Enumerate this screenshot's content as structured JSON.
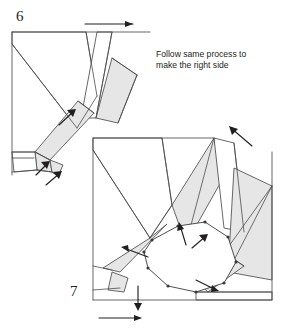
{
  "document": {
    "type": "origami-instruction-diagram",
    "width": 282,
    "height": 331
  },
  "steps": [
    {
      "id": "step-6",
      "number": "6",
      "number_x": 16,
      "number_y": 21,
      "caption": null
    },
    {
      "id": "step-7",
      "number": "7",
      "number_x": 70,
      "number_y": 296,
      "caption": null
    }
  ],
  "caption": {
    "line1": "Follow same process to",
    "line2": "make the right side",
    "x": 156,
    "line1_y": 57,
    "line2_y": 68
  },
  "colors": {
    "paper_white": "#ffffff",
    "paper_shaded": "#e6e6e6",
    "line": "#4d4d4d",
    "ring_line": "#3a3a3a",
    "arrow": "#231f20",
    "text": "#231f20",
    "background": "#ffffff"
  },
  "figure6": {
    "name": "step-6-figure",
    "outline": "M12,32 L150,32 L150,34 M12,32 L12,175",
    "top_edge": "M12,32 L150,32",
    "left_edge": "M12,32 L12,175",
    "bottom_edge": "M12,158 L34,158",
    "faces": [
      {
        "name": "upper-left-triangle-face",
        "points": "12,32 12,44 77,128 97,96 86,32",
        "shaded": false
      },
      {
        "name": "right-flap-white",
        "points": "97,32 112,32 96,118 81,118",
        "shaded": false
      },
      {
        "name": "right-shaded-flap",
        "points": "112,58 137,75 118,123 96,118",
        "shaded": true
      },
      {
        "name": "diagonal-shaded-strip",
        "points": "78,101 94,113 50,160 35,152",
        "shaded": true
      },
      {
        "name": "lower-shaded-tab",
        "points": "35,152 50,160 52,172 37,170",
        "shaded": true
      },
      {
        "name": "lower-left-white-cell",
        "points": "12,152 35,152 37,170 14,172",
        "shaded": false
      },
      {
        "name": "corner-gusset",
        "points": "50,160 63,165 58,176 52,172",
        "shaded": true
      }
    ],
    "creases": [
      "M12,44 L77,128",
      "M86,32 L97,96",
      "M97,96 L77,128",
      "M112,32 L96,118",
      "M112,58 L137,75",
      "M137,75 L118,123",
      "M78,101 L94,113",
      "M35,152 L50,160",
      "M12,152 L35,152",
      "M12,172 L37,170",
      "M37,170 L52,172",
      "M52,172 L58,176"
    ],
    "arrows": [
      {
        "name": "top-translate-arrow",
        "direction": "right",
        "path": "M85,24 L133,24",
        "head": "133,24 125,21 125,27"
      },
      {
        "name": "mid-fold-arrow",
        "direction": "up-right",
        "path": "M59,125 L74,111",
        "head": "76,109 67,110 73,117"
      },
      {
        "name": "lower-fold-arrow",
        "direction": "up-right",
        "path": "M36,175 L48,163",
        "head": "50,161 41,162 47,169"
      },
      {
        "name": "bottom-fold-arrow",
        "direction": "up-right",
        "path": "M46,185 L60,173",
        "head": "62,171 53,172 59,179"
      }
    ]
  },
  "figure7": {
    "name": "step-7-figure",
    "outline_left": "M93,138 L93,300",
    "outline_top": "M93,138 L214,138",
    "outline_right": "M272,152 L272,300",
    "outline_bottom": "M93,300 L272,300",
    "faces": [
      {
        "name": "upper-left-triangle-face",
        "points": "93,138 93,150 150,238 172,205 162,138",
        "shaded": false
      },
      {
        "name": "left-shaded-strip",
        "points": "150,238 167,224 120,272 103,268",
        "shaded": true
      },
      {
        "name": "center-shaded-flap",
        "points": "172,205 214,138 222,180 186,244",
        "shaded": true
      },
      {
        "name": "right-upper-white-flap",
        "points": "214,138 234,143 244,232 224,228",
        "shaded": false
      },
      {
        "name": "right-shaded-flap",
        "points": "234,168 272,186 272,280 228,272",
        "shaded": true
      },
      {
        "name": "lower-right-white-region",
        "points": "196,292 272,292 272,300 196,300",
        "shaded": false
      },
      {
        "name": "bottom-shaded-tab",
        "points": "196,281 232,258 244,266 208,292",
        "shaded": true
      },
      {
        "name": "bottom-left-gusset",
        "points": "112,272 128,278 124,292 108,290",
        "shaded": true
      }
    ],
    "creases": [
      "M93,150 L150,238",
      "M162,138 L172,205",
      "M172,205 L150,238",
      "M214,138 L186,244",
      "M234,143 L244,232",
      "M272,186 L228,272",
      "M93,266 L112,270",
      "M93,290 L120,288",
      "M196,292 L272,292",
      "M272,186 L196,292",
      "M232,258 L244,266"
    ],
    "ring": {
      "name": "central-ring",
      "points": "152,240 178,226 205,222 228,237 236,262 224,283 196,292 168,286 148,268 144,252",
      "vertices": [
        [
          152,
          240
        ],
        [
          178,
          226
        ],
        [
          205,
          222
        ],
        [
          228,
          237
        ],
        [
          236,
          262
        ],
        [
          224,
          283
        ],
        [
          196,
          292
        ],
        [
          168,
          286
        ],
        [
          148,
          268
        ],
        [
          144,
          252
        ]
      ]
    },
    "arrows": [
      {
        "name": "top-right-pull-arrow",
        "direction": "up-left",
        "path": "M252,146 L231,128",
        "head": "229,126 232,135 238,129"
      },
      {
        "name": "center-fold-arrow-left",
        "direction": "up",
        "path": "M186,245 L180,225",
        "head": "179,222 177,231 184,229"
      },
      {
        "name": "center-fold-arrow-right",
        "direction": "up-right",
        "path": "M192,248 L206,236",
        "head": "208,234 199,235 205,242"
      },
      {
        "name": "left-inward-arrow",
        "direction": "left",
        "path": "M148,257 L124,248",
        "head": "121,247 129,252 128,245"
      },
      {
        "name": "right-inward-arrow",
        "direction": "down-right",
        "path": "M196,280 L216,290",
        "head": "219,291 212,285 211,292"
      },
      {
        "name": "bottom-drop-arrow",
        "direction": "down",
        "path": "M138,286 L138,308",
        "head": "138,311 134,303 142,303"
      },
      {
        "name": "bottom-translate-arrow",
        "direction": "right",
        "path": "M99,318 L140,318",
        "head": "142,318 134,315 134,321"
      }
    ]
  }
}
